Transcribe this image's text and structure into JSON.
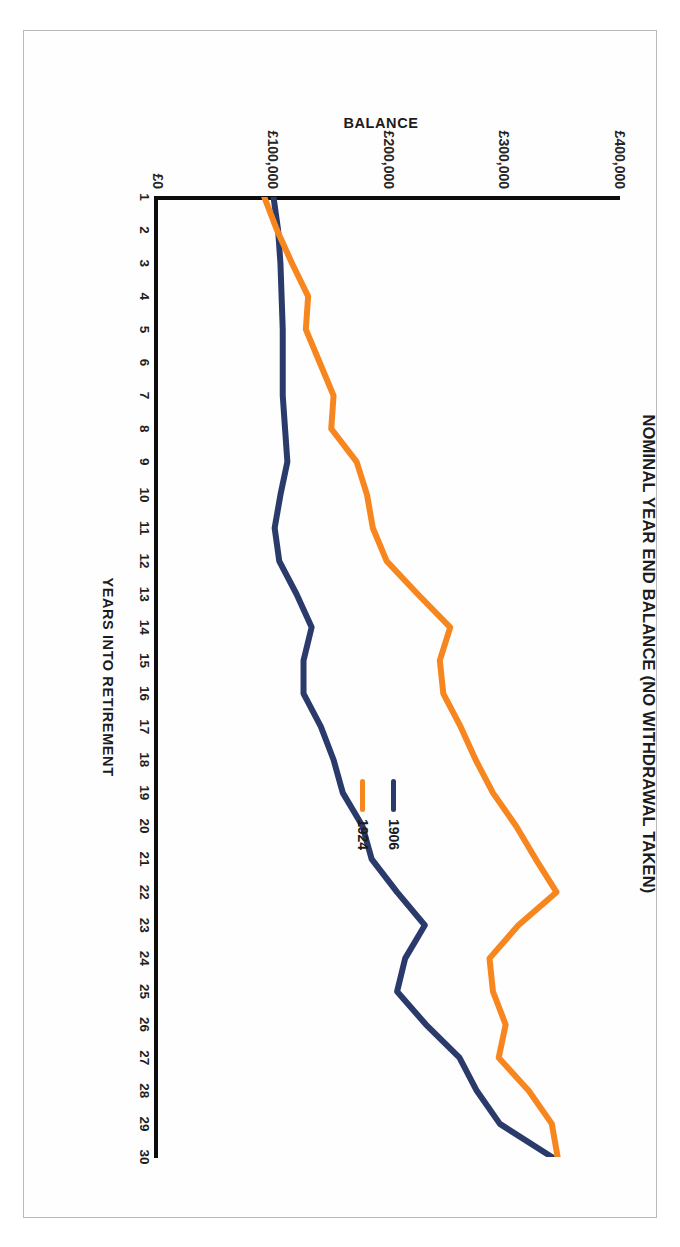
{
  "chart_data": {
    "type": "line",
    "title": "NOMINAL YEAR END BALANCE (NO WITHDRAWAL TAKEN)",
    "xlabel": "YEARS INTO RETIREMENT",
    "ylabel": "BALANCE",
    "orientation": "rotated-90-clockwise",
    "grid": false,
    "legend_position": "right-inside",
    "ylim": [
      0,
      400000
    ],
    "ytick_labels": [
      "£0",
      "£100,000",
      "£200,000",
      "£300,000",
      "£400,000"
    ],
    "ytick_values": [
      0,
      100000,
      200000,
      300000,
      400000
    ],
    "categories": [
      1,
      2,
      3,
      4,
      5,
      6,
      7,
      8,
      9,
      10,
      11,
      12,
      13,
      14,
      15,
      16,
      17,
      18,
      19,
      20,
      21,
      22,
      23,
      24,
      25,
      26,
      27,
      28,
      29,
      30
    ],
    "xtick_labels": [
      "1",
      "2",
      "3",
      "4",
      "5",
      "6",
      "7",
      "8",
      "9",
      "10",
      "11",
      "12",
      "13",
      "14",
      "15",
      "16",
      "17",
      "18",
      "19",
      "20",
      "21",
      "22",
      "23",
      "24",
      "25",
      "26",
      "27",
      "28",
      "29",
      "30"
    ],
    "series": [
      {
        "name": "1906",
        "color": "#2a3a6b",
        "values": [
          100000,
          104000,
          106000,
          107000,
          108000,
          108000,
          108000,
          110000,
          112000,
          106000,
          101000,
          105000,
          120000,
          133000,
          126000,
          126000,
          141000,
          152000,
          160000,
          177000,
          185000,
          207000,
          231000,
          214000,
          207000,
          232000,
          261000,
          276000,
          296000,
          341000
        ]
      },
      {
        "name": "1924",
        "color": "#f7861f",
        "values": [
          92000,
          103000,
          116000,
          130000,
          128000,
          140000,
          152000,
          150000,
          172000,
          181000,
          186000,
          198000,
          225000,
          253000,
          244000,
          247000,
          262000,
          275000,
          290000,
          310000,
          327000,
          345000,
          312000,
          287000,
          290000,
          301000,
          295000,
          321000,
          341000,
          346000
        ]
      }
    ]
  },
  "legend": {
    "items": [
      {
        "label": "1906",
        "color": "#2a3a6b"
      },
      {
        "label": "1924",
        "color": "#f7861f"
      }
    ]
  }
}
